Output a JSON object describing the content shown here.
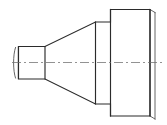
{
  "drawing": {
    "title": "Stepped Conical Shaft Front View",
    "type": "orthographic-front-view",
    "units": "px",
    "canvas": {
      "width": 167,
      "height": 125
    },
    "colors": {
      "background": "#ffffff",
      "outline": "#2b2b2b",
      "edge_line": "#555555",
      "centerline": "#6e6e6e"
    },
    "line_weights": {
      "outline": 1.15,
      "edge_line": 0.9,
      "centerline": 0.75
    },
    "centerline": {
      "name": "axis-of-revolution",
      "y": 62.5,
      "x_start": 12,
      "x_end": 164,
      "dash_pattern": "9 3 2 3"
    },
    "features": [
      {
        "id": "left-chamfer-lip",
        "label": "Left End Chamfer Lip",
        "shape": "arc-edge",
        "x": 15.5,
        "y_top": 47.5,
        "y_bottom": 78.0,
        "bulge": 2.6
      },
      {
        "id": "small-cylinder",
        "label": "Small Diameter Cylinder",
        "shape": "rectangle",
        "x_left": 18.5,
        "x_right": 45.0,
        "y_top": 46.5,
        "y_bottom": 79.0
      },
      {
        "id": "tapered-cone",
        "label": "Tapered Cone Section",
        "shape": "trapezoid",
        "x_left": 45.0,
        "x_right": 95.5,
        "y_top_left": 46.5,
        "y_bottom_left": 79.0,
        "y_top_right": 22.0,
        "y_bottom_right": 104.0
      },
      {
        "id": "middle-cylinder",
        "label": "Middle Diameter Cylinder",
        "shape": "rectangle",
        "x_left": 95.5,
        "x_right": 110.5,
        "y_top": 22.0,
        "y_bottom": 104.0
      },
      {
        "id": "large-cylinder",
        "label": "Large Diameter Flange Cylinder",
        "shape": "rectangle",
        "x_left": 110.5,
        "x_right": 150.0,
        "y_top": 9.5,
        "y_bottom": 116.0
      },
      {
        "id": "right-end-edge",
        "label": "Right End Offset Edge Line",
        "shape": "offset-line",
        "x": 155.0,
        "y_top": 12.5,
        "y_bottom": 119.0,
        "offset_x": 5.0,
        "offset_y": 3.0
      }
    ]
  }
}
